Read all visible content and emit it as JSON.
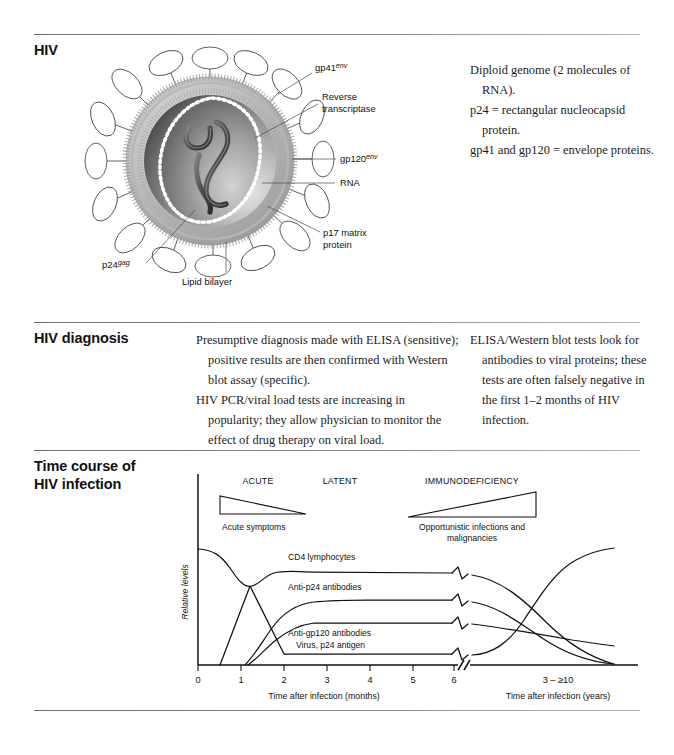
{
  "page": {
    "background": "#ffffff",
    "rule_color": "#6d6d6d"
  },
  "sections": [
    {
      "id": "hiv",
      "heading": "HIV",
      "notes": [
        "Diploid genome (2 molecules of RNA).",
        "p24 = rectangular nucleocapsid protein.",
        "gp41 and gp120 = envelope proteins."
      ]
    },
    {
      "id": "hiv-diagnosis",
      "heading": "HIV diagnosis",
      "column1": [
        "Presumptive diagnosis made with ELISA (sensitive); positive results are then confirmed with Western blot assay (specific).",
        "HIV PCR/viral load tests are increasing in popularity; they allow physician to monitor the effect of drug therapy on viral load."
      ],
      "column2": [
        "ELISA/Western blot tests look for antibodies to viral proteins; these tests are often falsely negative in the first 1–2 months of HIV infection."
      ]
    },
    {
      "id": "time-course",
      "heading_line1": "Time course of",
      "heading_line2": "HIV infection"
    }
  ],
  "virion_figure": {
    "name": "hiv-virion-diagram",
    "labels": {
      "gp41": {
        "text": "gp41",
        "sup": "env"
      },
      "reverse_transcriptase_line1": "Reverse",
      "reverse_transcriptase_line2": "transcriptase",
      "gp120": {
        "text": "gp120",
        "sup": "env"
      },
      "rna": "RNA",
      "p17_line1": "p17 matrix",
      "p17_line2": "protein",
      "p24": {
        "text": "p24",
        "sup": "gag"
      },
      "lipid_bilayer": "Lipid bilayer"
    }
  },
  "chart_data": {
    "type": "line",
    "name": "hiv-time-course-graph",
    "title": "Time course of HIV infection",
    "ylabel": "Relative levels",
    "grid": false,
    "legend_position": "inline-labels",
    "axes": [
      {
        "id": "left-axis",
        "xlabel": "Time after infection (months)",
        "tick_labels": [
          "0",
          "1",
          "2",
          "3",
          "4",
          "5",
          "6"
        ],
        "xlim": [
          0,
          6.5
        ],
        "ylim": [
          0,
          100
        ]
      },
      {
        "id": "right-axis",
        "xlabel": "Time after infection (years)",
        "tick_labels": [
          "3 – ≥10"
        ],
        "xlim": [
          3,
          10
        ],
        "ylim": [
          0,
          100
        ]
      }
    ],
    "phases": [
      {
        "label": "ACUTE",
        "x_center_months": 1.6
      },
      {
        "label": "LATENT",
        "x_center_months": 3.6
      },
      {
        "label": "IMMUNODEFICIENCY",
        "x_center_years": 6.5
      }
    ],
    "wedges": [
      {
        "label": "Acute symptoms",
        "direction": "decreasing",
        "phase": "ACUTE"
      },
      {
        "label": "Opportunistic infections and malignancies",
        "direction": "increasing",
        "phase": "IMMUNODEFICIENCY"
      }
    ],
    "series": [
      {
        "name": "CD4 lymphocytes",
        "label": "CD4 lymphocytes",
        "description": "Starts high, dips during acute phase, partially recovers, plateaus through latency, then declines steadily to near zero in immunodeficiency.",
        "points_months": [
          [
            0,
            88
          ],
          [
            0.6,
            84
          ],
          [
            1.0,
            68
          ],
          [
            1.3,
            58
          ],
          [
            1.6,
            62
          ],
          [
            2.0,
            70
          ],
          [
            2.6,
            72
          ],
          [
            4.0,
            71
          ],
          [
            6.2,
            70
          ]
        ],
        "points_years": [
          [
            3,
            68
          ],
          [
            5,
            52
          ],
          [
            7,
            34
          ],
          [
            9,
            16
          ],
          [
            10,
            4
          ]
        ]
      },
      {
        "name": "Anti-p24 antibodies",
        "label": "Anti-p24 antibodies",
        "description": "Rises from ~1.3 months, plateaus at intermediate level through latency, then falls to zero late in immunodeficiency.",
        "points_months": [
          [
            1.2,
            0
          ],
          [
            1.8,
            22
          ],
          [
            2.4,
            38
          ],
          [
            3.0,
            43
          ],
          [
            4.0,
            44
          ],
          [
            6.2,
            44
          ]
        ],
        "points_years": [
          [
            3,
            42
          ],
          [
            6,
            24
          ],
          [
            8,
            10
          ],
          [
            10,
            0
          ]
        ]
      },
      {
        "name": "Anti-gp120 antibodies",
        "label": "Anti-gp120 antibodies",
        "description": "Rises from ~1.3 months to a lower plateau, remains high through latency, declines slowly in immunodeficiency.",
        "points_months": [
          [
            1.25,
            0
          ],
          [
            1.9,
            18
          ],
          [
            2.5,
            30
          ],
          [
            3.2,
            31
          ],
          [
            4.5,
            31
          ],
          [
            6.2,
            31
          ]
        ],
        "points_years": [
          [
            3,
            30
          ],
          [
            6,
            22
          ],
          [
            8,
            16
          ],
          [
            10,
            12
          ]
        ]
      },
      {
        "name": "Virus, p24 antigen",
        "label": "Virus, p24 antigen",
        "description": "Sharp spike during acute infection (~1.3 months), falls to near-baseline during latency, then rises steeply again in immunodeficiency.",
        "points_months": [
          [
            0.5,
            0
          ],
          [
            1.25,
            46
          ],
          [
            2.1,
            6
          ],
          [
            3.0,
            6
          ],
          [
            6.2,
            6
          ]
        ],
        "points_years": [
          [
            3,
            6
          ],
          [
            5.5,
            22
          ],
          [
            7,
            48
          ],
          [
            8.5,
            60
          ],
          [
            10,
            63
          ]
        ]
      }
    ]
  }
}
